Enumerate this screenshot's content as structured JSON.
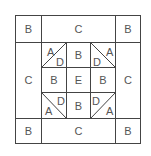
{
  "diagram": {
    "line_color": "#444444",
    "label_color": "#555555",
    "outer_row_top": [
      {
        "label": "B"
      },
      {
        "label": "C"
      },
      {
        "label": "B"
      }
    ],
    "middle_left": {
      "label": "C"
    },
    "middle_right": {
      "label": "C"
    },
    "outer_row_bottom": [
      {
        "label": "B"
      },
      {
        "label": "C"
      },
      {
        "label": "B"
      }
    ],
    "center_grid": {
      "top_left": {
        "a": "A",
        "d": "D"
      },
      "top_center": {
        "label": "B"
      },
      "top_right": {
        "a": "A",
        "d": "D"
      },
      "middle_left": {
        "label": "B"
      },
      "center": {
        "label": "E"
      },
      "middle_right": {
        "label": "B"
      },
      "bottom_left": {
        "a": "A",
        "d": "D"
      },
      "bottom_center": {
        "label": "B"
      },
      "bottom_right": {
        "a": "A",
        "d": "D"
      }
    }
  }
}
